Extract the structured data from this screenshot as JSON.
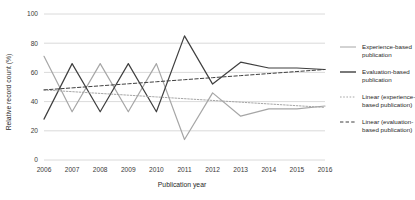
{
  "chart_data": {
    "type": "line",
    "title": "",
    "xlabel": "Publication year",
    "ylabel": "Relative record count (%)",
    "categories": [
      "2006",
      "2007",
      "2008",
      "2009",
      "2010",
      "2011",
      "2012",
      "2013",
      "2014",
      "2015",
      "2016"
    ],
    "x": [
      2006,
      2007,
      2008,
      2009,
      2010,
      2011,
      2012,
      2013,
      2014,
      2015,
      2016
    ],
    "xlim": [
      2006,
      2016
    ],
    "ylim": [
      0,
      100
    ],
    "yticks": [
      0,
      20,
      40,
      60,
      80,
      100
    ],
    "ytick_labels": [
      "0",
      "20",
      "40",
      "60",
      "80",
      "100"
    ],
    "grid": "horizontal",
    "legend_position": "right",
    "series": [
      {
        "name": "Experience-based publication",
        "style": "solid",
        "color": "#a6a6a6",
        "values": [
          71,
          33,
          66,
          33,
          66,
          14,
          46,
          30,
          35,
          35,
          37
        ]
      },
      {
        "name": "Evaluation-based publication",
        "style": "solid",
        "color": "#3f3f3f",
        "values": [
          28,
          66,
          33,
          66,
          33,
          85,
          52,
          67,
          63,
          63,
          62
        ]
      },
      {
        "name": "Linear (experience-based publication)",
        "style": "dotted",
        "color": "#a6a6a6",
        "values": [
          48.0,
          46.8,
          45.6,
          44.4,
          43.2,
          42.0,
          40.8,
          39.6,
          38.4,
          37.2,
          36.0
        ]
      },
      {
        "name": "Linear (evaluation-based publication)",
        "style": "dashed",
        "color": "#3f3f3f",
        "values": [
          48.0,
          49.4,
          50.8,
          52.2,
          53.6,
          55.0,
          56.4,
          57.8,
          59.2,
          60.6,
          62.0
        ]
      }
    ]
  },
  "legend": {
    "items": [
      {
        "label_line1": "Experience-based",
        "label_line2": "publication",
        "swatch": "solid-light"
      },
      {
        "label_line1": "Evaluation-based",
        "label_line2": "publication",
        "swatch": "solid-dark"
      },
      {
        "label_line1": "Linear (experience-",
        "label_line2": "based publication)",
        "swatch": "dotted-light"
      },
      {
        "label_line1": "Linear (evaluation-",
        "label_line2": "based publication)",
        "swatch": "dashed-dark"
      }
    ]
  },
  "colors": {
    "experience": "#a6a6a6",
    "evaluation": "#3f3f3f",
    "grid": "#d0d0d0",
    "background": "#ffffff"
  }
}
